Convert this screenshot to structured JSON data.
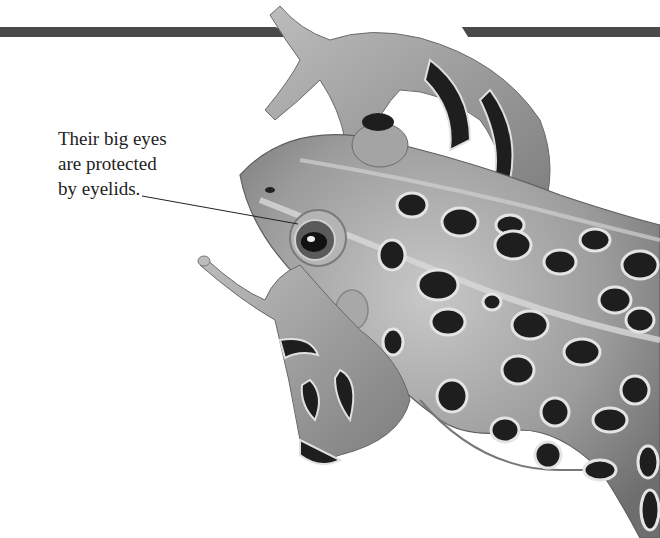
{
  "page": {
    "caption_lines": [
      "Their big eyes",
      "are protected",
      "by eyelids."
    ],
    "illustration": "leopard-frog-grayscale",
    "colors": {
      "bar": "#4a4a4a",
      "body": "#9a9a9a",
      "body_light": "#c4c4c4",
      "spot": "#1e1e1e",
      "spot_rim": "#e0e0e0",
      "text": "#222222",
      "background": "#ffffff"
    }
  }
}
